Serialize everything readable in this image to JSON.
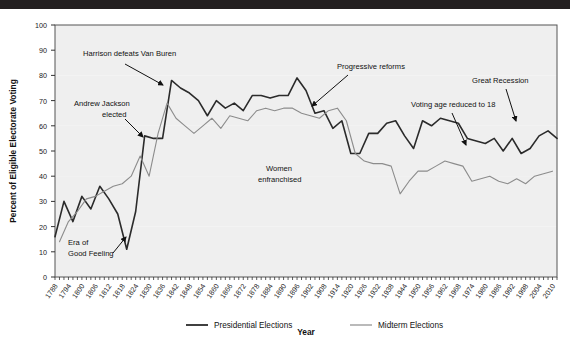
{
  "chart_data": {
    "type": "line",
    "title": "",
    "xlabel": "Year",
    "ylabel": "Percent of Eligible Electorate Voting",
    "ylim": [
      0,
      100
    ],
    "xlim": [
      1788,
      2012
    ],
    "ytick_step": 10,
    "yticks": [
      0,
      10,
      20,
      30,
      40,
      50,
      60,
      70,
      80,
      90,
      100
    ],
    "xticks": [
      1788,
      1794,
      1800,
      1806,
      1812,
      1818,
      1824,
      1830,
      1836,
      1842,
      1848,
      1854,
      1860,
      1866,
      1872,
      1878,
      1884,
      1890,
      1896,
      1902,
      1908,
      1914,
      1920,
      1926,
      1932,
      1938,
      1944,
      1950,
      1956,
      1962,
      1968,
      1974,
      1980,
      1986,
      1992,
      1998,
      2004,
      2010
    ],
    "xtick_label_interval_years": 6,
    "minor_tick_interval_years": 2,
    "grid": "horizontal-banding",
    "legend_position": "bottom-center",
    "series": [
      {
        "name": "Presidential Elections",
        "color": "#2b2b2b",
        "x": [
          1788,
          1792,
          1796,
          1800,
          1804,
          1808,
          1812,
          1816,
          1820,
          1824,
          1828,
          1832,
          1836,
          1840,
          1844,
          1848,
          1852,
          1856,
          1860,
          1864,
          1868,
          1872,
          1876,
          1880,
          1884,
          1888,
          1892,
          1896,
          1900,
          1904,
          1908,
          1912,
          1916,
          1920,
          1924,
          1928,
          1932,
          1936,
          1940,
          1944,
          1948,
          1952,
          1956,
          1960,
          1964,
          1968,
          1972,
          1976,
          1980,
          1984,
          1988,
          1992,
          1996,
          2000,
          2004,
          2008,
          2012
        ],
        "values": [
          16,
          30,
          22,
          32,
          27,
          36,
          31,
          25,
          11,
          26,
          56,
          55,
          55,
          78,
          75,
          73,
          70,
          64,
          70,
          67,
          69,
          66,
          72,
          72,
          71,
          72,
          72,
          79,
          74,
          65,
          66,
          59,
          62,
          49,
          49,
          57,
          57,
          61,
          62,
          56,
          51,
          62,
          60,
          63,
          62,
          61,
          55,
          54,
          53,
          55,
          50,
          55,
          49,
          51,
          56,
          58,
          55
        ],
        "annotation_notes": "biennial presidential election turnout, percent"
      },
      {
        "name": "Midterm Elections",
        "color": "#8c8c8c",
        "x": [
          1790,
          1794,
          1798,
          1802,
          1806,
          1810,
          1814,
          1818,
          1822,
          1826,
          1830,
          1834,
          1838,
          1842,
          1846,
          1850,
          1854,
          1858,
          1862,
          1866,
          1870,
          1874,
          1878,
          1882,
          1886,
          1890,
          1894,
          1898,
          1902,
          1906,
          1910,
          1914,
          1918,
          1922,
          1926,
          1930,
          1934,
          1938,
          1942,
          1946,
          1950,
          1954,
          1958,
          1962,
          1966,
          1970,
          1974,
          1978,
          1982,
          1986,
          1990,
          1994,
          1998,
          2002,
          2006,
          2010
        ],
        "values": [
          14,
          22,
          26,
          31,
          32,
          34,
          36,
          37,
          40,
          48,
          40,
          57,
          69,
          63,
          60,
          57,
          60,
          63,
          59,
          64,
          63,
          62,
          66,
          67,
          66,
          67,
          67,
          65,
          64,
          63,
          66,
          67,
          62,
          49,
          46,
          45,
          45,
          44,
          33,
          38,
          42,
          42,
          44,
          46,
          45,
          44,
          38,
          39,
          40,
          38,
          37,
          39,
          37,
          40,
          41,
          42
        ],
        "annotation_notes": "midterm election turnout, percent"
      }
    ],
    "annotations": [
      {
        "label": "Harrison defeats Van Buren",
        "text_x": 83,
        "text_y": 47,
        "arrow_from_x": 125,
        "arrow_from_y": 55,
        "arrow_to_x": 163,
        "arrow_to_y": 76
      },
      {
        "label": "Andrew Jackson\nelected",
        "line1": "Andrew Jackson",
        "line2": "elected",
        "text_x": 74,
        "text_y": 97,
        "arrow_from_x": 125,
        "arrow_from_y": 110,
        "arrow_to_x": 143,
        "arrow_to_y": 128
      },
      {
        "label": "Era of\nGood Feeling",
        "line1": "Era of",
        "line2": "Good Feeling",
        "text_x": 68,
        "text_y": 236,
        "arrow_from_x": 113,
        "arrow_from_y": 244,
        "arrow_to_x": 126,
        "arrow_to_y": 228
      },
      {
        "label": "Progressive reforms",
        "text_x": 337,
        "text_y": 60,
        "arrow_from_x": 348,
        "arrow_from_y": 66,
        "arrow_to_x": 312,
        "arrow_to_y": 97
      },
      {
        "label": "Women\nenfranchised",
        "line1": "Women",
        "line2": "enfranchised",
        "text_x": 266,
        "text_y": 162,
        "arrow_from_x": 0,
        "arrow_from_y": 0,
        "arrow_to_x": 0,
        "arrow_to_y": 0
      },
      {
        "label": "Voting age reduced to 18",
        "text_x": 411,
        "text_y": 98,
        "arrow_from_x": 452,
        "arrow_from_y": 104,
        "arrow_to_x": 466,
        "arrow_to_y": 136
      },
      {
        "label": "Great Recession",
        "text_x": 472,
        "text_y": 74,
        "arrow_from_x": 506,
        "arrow_from_y": 80,
        "arrow_to_x": 516,
        "arrow_to_y": 112
      }
    ]
  },
  "axes": {
    "y_title": "Percent of Eligible Electorate Voting",
    "x_title": "Year",
    "y_labels": [
      "100",
      "90",
      "80",
      "70",
      "60",
      "50",
      "40",
      "30",
      "20",
      "10",
      "0"
    ],
    "x_labels": [
      "1788",
      "1794",
      "1800",
      "1806",
      "1812",
      "1818",
      "1824",
      "1830",
      "1836",
      "1842",
      "1848",
      "1854",
      "1860",
      "1866",
      "1872",
      "1878",
      "1884",
      "1890",
      "1896",
      "1902",
      "1908",
      "1914",
      "1920",
      "1926",
      "1932",
      "1938",
      "1944",
      "1950",
      "1956",
      "1962",
      "1968",
      "1974",
      "1980",
      "1986",
      "1992",
      "1998",
      "2004",
      "2010"
    ]
  },
  "legend": {
    "items": [
      {
        "label": "Presidential Elections",
        "color": "#2b2b2b"
      },
      {
        "label": "Midterm Elections",
        "color": "#8c8c8c"
      }
    ]
  },
  "colors": {
    "presidential": "#2b2b2b",
    "midterm": "#8c8c8c",
    "band": "#efefef",
    "frame": "#555555",
    "topbar": "#231f20"
  }
}
